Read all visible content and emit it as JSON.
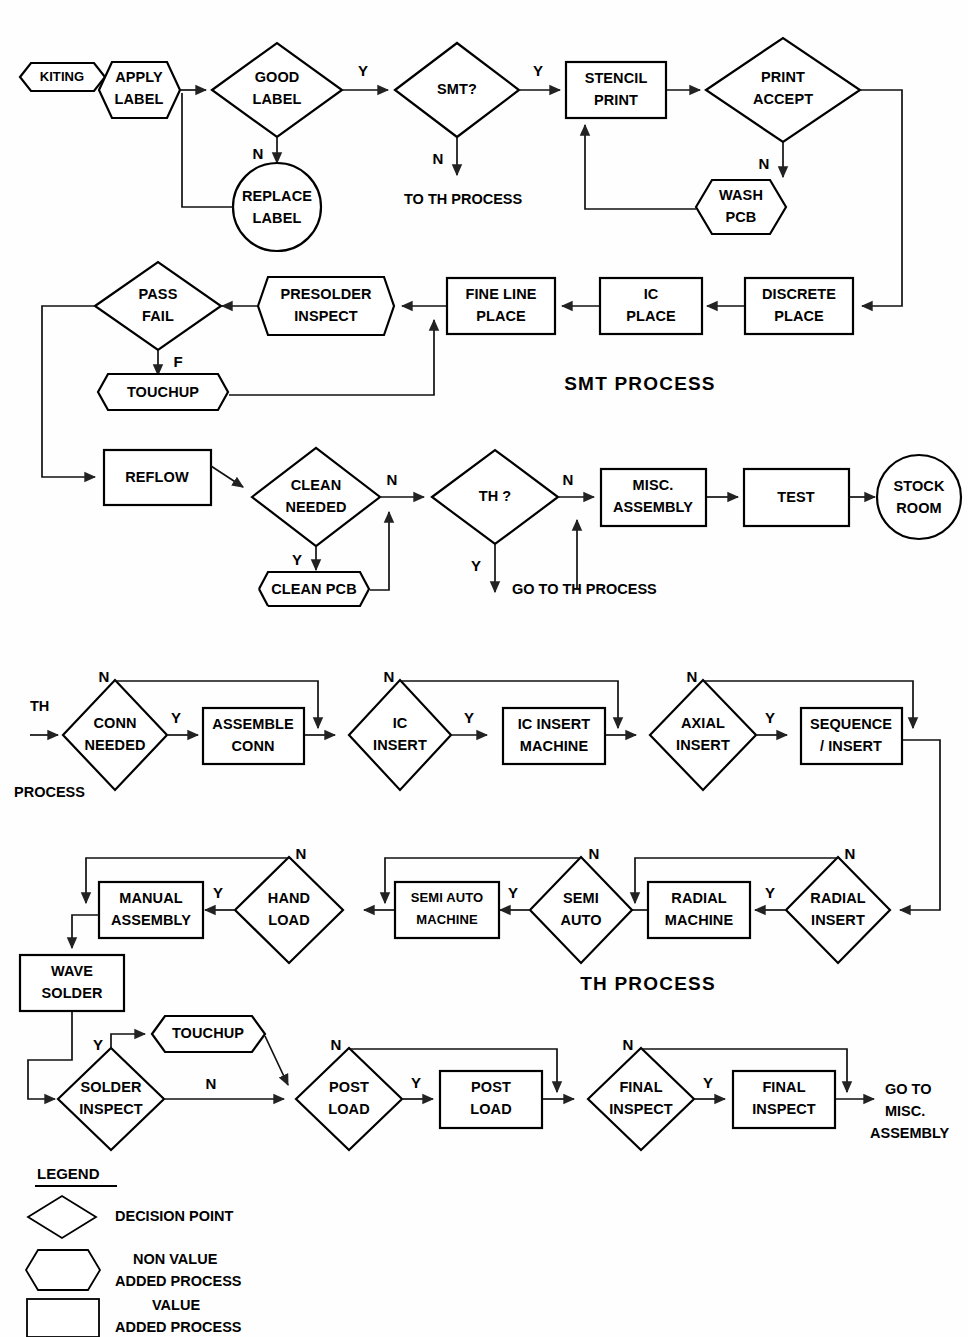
{
  "diagram": {
    "title_smt": "SMT  PROCESS",
    "title_th_1": "TH  PROCESS",
    "title_th_2": "TH  PROCESS"
  },
  "smt": {
    "n1": "KITING",
    "n2_l1": "APPLY",
    "n2_l2": "LABEL",
    "n3_l1": "GOOD",
    "n3_l2": "LABEL",
    "n4_l1": "REPLACE",
    "n4_l2": "LABEL",
    "n5": "SMT?",
    "n6_l1": "STENCIL",
    "n6_l2": "PRINT",
    "n7_l1": "PRINT",
    "n7_l2": "ACCEPT",
    "n8_l1": "WASH",
    "n8_l2": "PCB",
    "n9_l1": "DISCRETE",
    "n9_l2": "PLACE",
    "n10_l1": "IC",
    "n10_l2": "PLACE",
    "n11_l1": "FINE LINE",
    "n11_l2": "PLACE",
    "n12_l1": "PRESOLDER",
    "n12_l2": "INSPECT",
    "n13_l1": "PASS",
    "n13_l2": "FAIL",
    "n14": "TOUCHUP",
    "n15": "REFLOW",
    "n16_l1": "CLEAN",
    "n16_l2": "NEEDED",
    "n17": "CLEAN PCB",
    "n18": "TH ?",
    "n19_l1": "MISC.",
    "n19_l2": "ASSEMBLY",
    "n20": "TEST",
    "n21_l1": "STOCK",
    "n21_l2": "ROOM",
    "note_to_th": "TO TH PROCESS",
    "note_go_th": "GO TO TH PROCESS"
  },
  "th": {
    "entry_l1": "TH",
    "entry_l2": "PROCESS",
    "n1_l1": "CONN",
    "n1_l2": "NEEDED",
    "n2_l1": "ASSEMBLE",
    "n2_l2": "CONN",
    "n3_l1": "IC",
    "n3_l2": "INSERT",
    "n4_l1": "IC INSERT",
    "n4_l2": "MACHINE",
    "n5_l1": "AXIAL",
    "n5_l2": "INSERT",
    "n6_l1": "SEQUENCE",
    "n6_l2": "/ INSERT",
    "n7_l1": "RADIAL",
    "n7_l2": "INSERT",
    "n8_l1": "RADIAL",
    "n8_l2": "MACHINE",
    "n9_l1": "SEMI",
    "n9_l2": "AUTO",
    "n10_l1": "SEMI AUTO",
    "n10_l2": "MACHINE",
    "n11_l1": "HAND",
    "n11_l2": "LOAD",
    "n12_l1": "MANUAL",
    "n12_l2": "ASSEMBLY",
    "n13_l1": "WAVE",
    "n13_l2": "SOLDER",
    "n14_l1": "SOLDER",
    "n14_l2": "INSPECT",
    "n15": "TOUCHUP",
    "n16_l1": "POST",
    "n16_l2": "LOAD",
    "n17_l1": "POST",
    "n17_l2": "LOAD",
    "n18_l1": "FINAL",
    "n18_l2": "INSPECT",
    "n19_l1": "FINAL",
    "n19_l2": "INSPECT",
    "exit_l1": "GO TO",
    "exit_l2": "MISC.",
    "exit_l3": "ASSEMBLY"
  },
  "branch_labels": {
    "y": "Y",
    "n": "N",
    "f": "F"
  },
  "legend": {
    "title": "LEGEND",
    "items": [
      {
        "shape": "diamond",
        "line1": "DECISION POINT",
        "line2": ""
      },
      {
        "shape": "hexagon",
        "line1": "NON VALUE",
        "line2": "ADDED PROCESS"
      },
      {
        "shape": "rect",
        "line1": "VALUE",
        "line2": "ADDED PROCESS"
      }
    ]
  },
  "colors": {
    "stroke": "#000000",
    "fill": "#ffffff",
    "background": "#fefefe"
  }
}
